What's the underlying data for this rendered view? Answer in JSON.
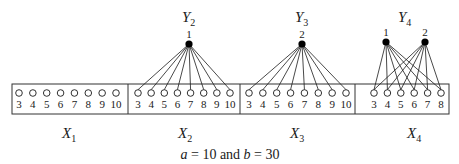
{
  "diagram": {
    "caption": {
      "a_label": "a",
      "eq1": " = 10 and ",
      "b_label": "b",
      "eq2": " = 30"
    },
    "colors": {
      "stroke": "#1a1a1a",
      "node_fill": "#000000",
      "box": "#333333"
    },
    "groups": [
      {
        "name": "X",
        "sub": "1",
        "node_labels": [
          "3",
          "4",
          "5",
          "6",
          "7",
          "8",
          "9",
          "10"
        ]
      },
      {
        "name": "X",
        "sub": "2",
        "node_labels": [
          "3",
          "4",
          "5",
          "6",
          "7",
          "8",
          "9",
          "10"
        ]
      },
      {
        "name": "X",
        "sub": "3",
        "node_labels": [
          "3",
          "4",
          "5",
          "6",
          "7",
          "8",
          "9",
          "10"
        ]
      },
      {
        "name": "X",
        "sub": "4",
        "node_labels": [
          "3",
          "4",
          "5",
          "6",
          "7",
          "8"
        ]
      }
    ],
    "y_nodes": [
      {
        "group_name": "Y",
        "group_sub": "2",
        "nodes": [
          {
            "label": "1"
          }
        ]
      },
      {
        "group_name": "Y",
        "group_sub": "3",
        "nodes": [
          {
            "label": "2"
          }
        ]
      },
      {
        "group_name": "Y",
        "group_sub": "4",
        "nodes": [
          {
            "label": "1"
          },
          {
            "label": "2"
          }
        ]
      }
    ]
  }
}
